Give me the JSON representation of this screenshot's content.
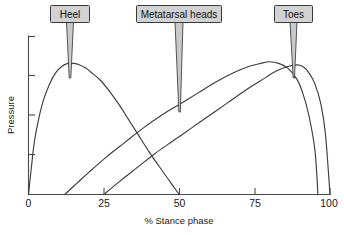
{
  "chart_data": {
    "type": "line",
    "title": "",
    "xlabel": "% Stance phase",
    "ylabel": "Pressure",
    "xlim": [
      0,
      100
    ],
    "ylim": [
      0,
      100
    ],
    "xticks": [
      "0",
      "25",
      "50",
      "75",
      "100"
    ],
    "xtick_values": [
      0,
      25,
      50,
      75,
      100
    ],
    "ytick_values": [
      0,
      25,
      50,
      75,
      100
    ],
    "yticklabels": [
      "",
      "",
      "",
      "",
      ""
    ],
    "grid": false,
    "legend": "none",
    "series": [
      {
        "name": "Heel",
        "points": [
          [
            0,
            0
          ],
          [
            1,
            18
          ],
          [
            2,
            34
          ],
          [
            3.5,
            49
          ],
          [
            5,
            60
          ],
          [
            7,
            70
          ],
          [
            9,
            77
          ],
          [
            11,
            81
          ],
          [
            13,
            83
          ],
          [
            15,
            83
          ],
          [
            17,
            82
          ],
          [
            19,
            80
          ],
          [
            21,
            77
          ],
          [
            24,
            72
          ],
          [
            27,
            65
          ],
          [
            30,
            57
          ],
          [
            33,
            48
          ],
          [
            36,
            39
          ],
          [
            40,
            27
          ],
          [
            44,
            16
          ],
          [
            47,
            8
          ],
          [
            50,
            0
          ]
        ]
      },
      {
        "name": "Metatarsal heads",
        "points": [
          [
            12,
            0
          ],
          [
            16,
            7
          ],
          [
            20,
            14
          ],
          [
            26,
            24
          ],
          [
            32,
            33
          ],
          [
            38,
            42
          ],
          [
            44,
            50
          ],
          [
            50,
            57
          ],
          [
            56,
            64
          ],
          [
            62,
            71
          ],
          [
            68,
            77
          ],
          [
            73,
            81
          ],
          [
            77,
            83
          ],
          [
            80,
            84
          ],
          [
            83,
            83
          ],
          [
            86,
            80
          ],
          [
            89,
            73
          ],
          [
            91,
            64
          ],
          [
            93,
            50
          ],
          [
            95,
            28
          ],
          [
            96,
            0
          ]
        ]
      },
      {
        "name": "Toes",
        "points": [
          [
            25,
            0
          ],
          [
            30,
            8
          ],
          [
            36,
            17
          ],
          [
            42,
            26
          ],
          [
            48,
            34
          ],
          [
            54,
            42
          ],
          [
            60,
            50
          ],
          [
            66,
            58
          ],
          [
            72,
            66
          ],
          [
            77,
            72
          ],
          [
            82,
            78
          ],
          [
            86,
            81
          ],
          [
            89,
            82
          ],
          [
            91,
            81
          ],
          [
            93,
            77
          ],
          [
            95,
            70
          ],
          [
            97,
            57
          ],
          [
            98.5,
            38
          ],
          [
            100,
            0
          ]
        ]
      }
    ],
    "annotations": [
      {
        "label": "Heel",
        "box_center_pct": 14,
        "pointer_target_pct": 14,
        "pointer_target_pressure": 83
      },
      {
        "label": "Metatarsal heads",
        "box_center_pct": 50,
        "pointer_target_pct": 50,
        "pointer_target_pressure": 57
      },
      {
        "label": "Toes",
        "box_center_pct": 89,
        "pointer_target_pct": 89,
        "pointer_target_pressure": 82
      }
    ]
  },
  "axes": {
    "y_title": "Pressure",
    "x_title": "% Stance phase",
    "x_tick_labels": [
      "0",
      "25",
      "50",
      "75",
      "100"
    ]
  },
  "callouts": {
    "heel": "Heel",
    "metatarsal": "Metatarsal heads",
    "toes": "Toes"
  },
  "colors": {
    "curve_stroke": "#3d3d3d",
    "axis_stroke": "#4a4a4a",
    "callout_fill": "#d2d2d2",
    "callout_border": "#3a3a3a",
    "text": "#1a1a1a",
    "background": "#ffffff"
  }
}
